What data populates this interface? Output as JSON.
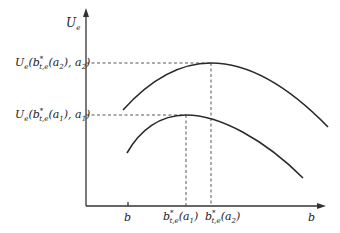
{
  "diagram": {
    "type": "utility-curves",
    "y_axis": {
      "label_base": "U",
      "label_sub": "e"
    },
    "x_axis": {
      "label": "b"
    },
    "x_ticks": [
      {
        "id": "b_min",
        "base": "b",
        "sup": "",
        "sub": "",
        "arg": ""
      },
      {
        "id": "b_star_a1",
        "base": "b",
        "sup": "*",
        "sub": "t,e",
        "arg_open": "(a",
        "arg_sub": "1",
        "arg_close": ")"
      },
      {
        "id": "b_star_a2",
        "base": "b",
        "sup": "*",
        "sub": "t,e",
        "arg_open": "(a",
        "arg_sub": "2",
        "arg_close": ")"
      }
    ],
    "y_ticks": [
      {
        "id": "U_a2",
        "base": "U",
        "sub": "e",
        "mid1": "(b",
        "sup": "*",
        "sub2": "t,e",
        "mid2": "(a",
        "sub3": "2",
        "mid3": "), a",
        "sub4": "2",
        "end": ")"
      },
      {
        "id": "U_a1",
        "base": "U",
        "sub": "e",
        "mid1": "(b",
        "sup": "*",
        "sub2": "t,e",
        "mid2": "(a",
        "sub3": "1",
        "mid3": "), a",
        "sub4": "1",
        "end": ")"
      }
    ],
    "curves": [
      {
        "name": "curve-a2",
        "description": "Upper concave curve U_e(b, a2), peak at b*_{t,e}(a2)"
      },
      {
        "name": "curve-a1",
        "description": "Lower concave curve U_e(b, a1), peak at b*_{t,e}(a1)"
      }
    ]
  }
}
